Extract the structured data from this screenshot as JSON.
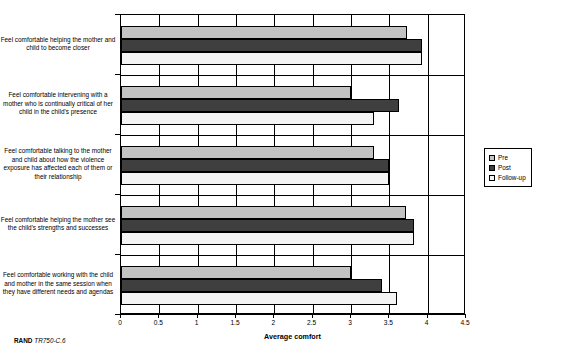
{
  "chart_data": {
    "type": "bar",
    "orientation": "horizontal",
    "title": "",
    "xlabel": "Average comfort",
    "ylabel": "",
    "xlim": [
      0,
      4.5
    ],
    "xticks": [
      "0",
      "0.5",
      "1",
      "1.5",
      "2",
      "2.5",
      "3",
      "3.5",
      "4",
      "4.5"
    ],
    "xtick_values": [
      0,
      0.5,
      1,
      1.5,
      2,
      2.5,
      3,
      3.5,
      4,
      4.5
    ],
    "grid": true,
    "legend_position": "right",
    "categories": [
      "Feel comfortable helping the mother and child to become closer",
      "Feel comfortable intervening with a mother who is continually critical of her child in the child's presence",
      "Feel comfortable talking to the mother and child about how the violence exposure has affected each of them or their relationship",
      "Feel comfortable helping the mother see the child's strengths and successes",
      "Feel comfortable working with the child and mother in the same session when they have different needs and agendas"
    ],
    "series": [
      {
        "name": "Pre",
        "color": "#c3c3c3",
        "values": [
          3.73,
          3.0,
          3.3,
          3.72,
          3.0
        ]
      },
      {
        "name": "Post",
        "color": "#3f3f3f",
        "values": [
          3.93,
          3.62,
          3.5,
          3.82,
          3.4
        ]
      },
      {
        "name": "Follow-up",
        "color": "#f4f4f4",
        "values": [
          3.93,
          3.3,
          3.5,
          3.82,
          3.6
        ]
      }
    ]
  },
  "legend": {
    "items": [
      {
        "label": "Pre"
      },
      {
        "label": "Post"
      },
      {
        "label": "Follow-up"
      }
    ]
  },
  "footer": {
    "brand": "RAND",
    "document_id": "TR750-C.6"
  }
}
